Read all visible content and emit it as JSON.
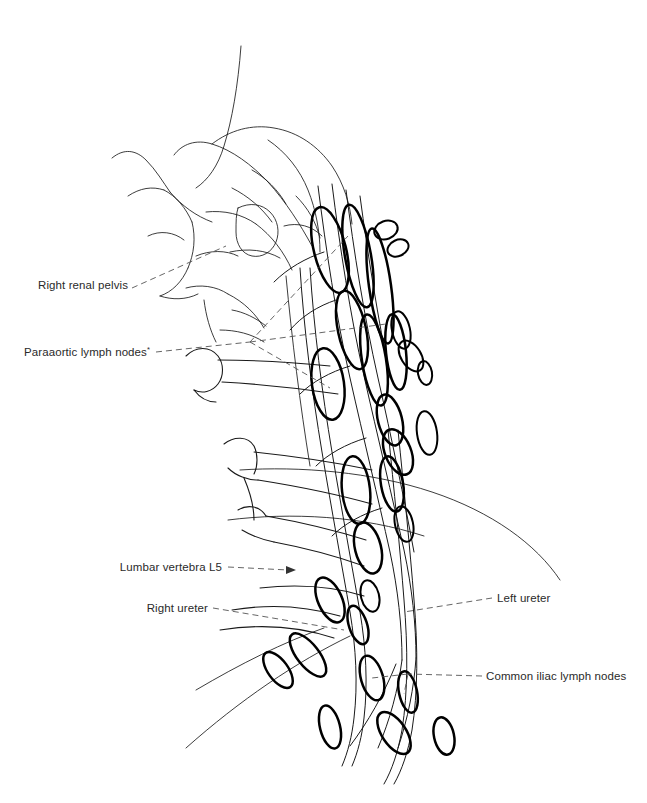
{
  "figure": {
    "background_color": "#ffffff",
    "ink_color": "#1a1a1a",
    "leader_color": "#555555",
    "width": 647,
    "height": 803
  },
  "labels": [
    {
      "id": "right-renal-pelvis",
      "text": "Right renal pelvis",
      "superscript": "",
      "align": "end",
      "x": 128,
      "y": 285,
      "leader_style": "dashed",
      "has_arrowhead": false
    },
    {
      "id": "paraaortic-lymph-nodes",
      "text": "Paraaortic lymph nodes",
      "superscript": "*",
      "align": "end",
      "x": 150,
      "y": 352,
      "leader_style": "dashed-branched",
      "has_arrowhead": false
    },
    {
      "id": "lumbar-vertebra-l5",
      "text": "Lumbar vertebra L5",
      "superscript": "",
      "align": "end",
      "x": 222,
      "y": 570,
      "leader_style": "dashed",
      "has_arrowhead": true
    },
    {
      "id": "right-ureter",
      "text": "Right ureter",
      "superscript": "",
      "align": "end",
      "x": 208,
      "y": 610,
      "leader_style": "dashed",
      "has_arrowhead": false
    },
    {
      "id": "left-ureter",
      "text": "Left ureter",
      "superscript": "",
      "align": "start",
      "x": 497,
      "y": 601,
      "leader_style": "dashed",
      "has_arrowhead": false
    },
    {
      "id": "common-iliac-lymph-nodes",
      "text": "Common iliac lymph nodes",
      "superscript": "",
      "align": "start",
      "x": 486,
      "y": 676,
      "leader_style": "dashed-branched",
      "has_arrowhead": false
    }
  ],
  "structures": [
    {
      "id": "kidney-renal-pelvis",
      "name": "Right renal pelvis and calyces"
    },
    {
      "id": "vertebral-column",
      "name": "Lumbar vertebrae with transverse processes"
    },
    {
      "id": "aorta-ivc",
      "name": "Abdominal aorta and inferior vena cava"
    },
    {
      "id": "right-ureter-vessel",
      "name": "Right ureter"
    },
    {
      "id": "left-ureter-vessel",
      "name": "Left ureter"
    },
    {
      "id": "paraaortic-node-chain",
      "name": "Paraaortic lymph node chain"
    },
    {
      "id": "common-iliac-node-group",
      "name": "Common iliac lymph node group"
    }
  ]
}
